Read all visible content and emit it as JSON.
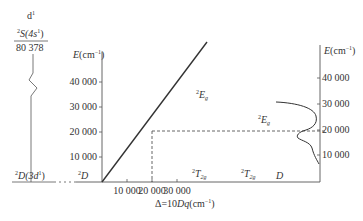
{
  "left_panel": {
    "config_label": "d",
    "config_sup": "1",
    "upper_state_sup": "2",
    "upper_state": "S(4s",
    "upper_state_inner_sup": "1",
    "upper_state_close": ")",
    "upper_energy": "80 378",
    "lower_state_sup": "2",
    "lower_state": "D(3d",
    "lower_state_inner_sup": "1",
    "lower_state_close": ")"
  },
  "main_plot": {
    "y_axis_label_E": "E",
    "y_axis_label_unit": "(cm",
    "y_axis_label_unit_sup": "−1",
    "y_axis_label_close": ")",
    "y_ticks": [
      "10 000",
      "20 000",
      "30 000",
      "40 000"
    ],
    "x_ticks": [
      "10 000",
      "20 000",
      "30 000"
    ],
    "x_axis_label_prefix": "Δ=10",
    "x_axis_label_Dq": "Dq",
    "x_axis_label_unit": "(cm",
    "x_axis_label_unit_sup": "−1",
    "x_axis_label_close": ")",
    "origin_state_sup": "2",
    "origin_state": "D",
    "line_label_sup": "2",
    "line_label": "E",
    "line_label_sub": "g",
    "ground_label_sup": "2",
    "ground_label": "T",
    "ground_label_sub": "2g"
  },
  "right_plot": {
    "y_axis_label_E": "E",
    "y_axis_label_unit": "(cm",
    "y_axis_label_unit_sup": "−1",
    "y_axis_label_close": ")",
    "y_ticks": [
      "10 000",
      "20 000",
      "30 000",
      "40 000"
    ],
    "band_label_sup": "2",
    "band_label": "E",
    "band_label_sub": "g",
    "ground_label_sup": "2",
    "ground_label": "T",
    "ground_label_sub": "2g",
    "axis_state_label": "D"
  },
  "colors": {
    "line": "#333333",
    "axis": "#555555",
    "dashed": "#555555"
  }
}
